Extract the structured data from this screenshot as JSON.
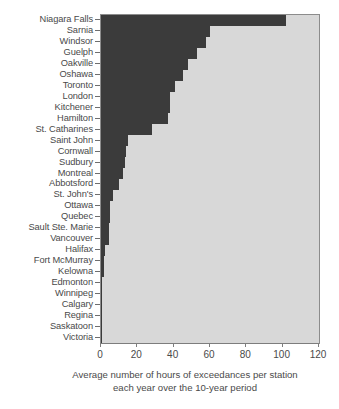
{
  "chart_data": {
    "type": "bar",
    "orientation": "horizontal",
    "title": "",
    "subtitle": "",
    "xlabel": "Average number of hours of exceedances per station each year over the 10-year period",
    "ylabel": "",
    "xlim": [
      0,
      120
    ],
    "xticks": [
      0,
      20,
      40,
      60,
      80,
      100,
      120
    ],
    "xtick_labels": [
      "0",
      "20",
      "40",
      "60",
      "80",
      "100",
      "120"
    ],
    "grid": false,
    "legend": false,
    "bar_color": "#3b3b3b",
    "plot_background": "#d8d8d8",
    "categories": [
      "Niagara Falls",
      "Sarnia",
      "Windsor",
      "Guelph",
      "Oakville",
      "Oshawa",
      "Toronto",
      "London",
      "Kitchener",
      "Hamilton",
      "St. Catharines",
      "Saint John",
      "Cornwall",
      "Sudbury",
      "Montreal",
      "Abbotsford",
      "St. John's",
      "Ottawa",
      "Quebec",
      "Sault Ste. Marie",
      "Vancouver",
      "Halifax",
      "Fort McMurray",
      "Kelowna",
      "Edmonton",
      "Winnipeg",
      "Calgary",
      "Regina",
      "Saskatoon",
      "Victoria"
    ],
    "values": [
      102,
      60,
      58,
      53,
      48,
      45,
      41,
      38,
      38,
      37,
      28,
      15,
      14,
      13,
      12,
      10,
      6.5,
      5,
      5,
      4.5,
      4.5,
      2,
      1.8,
      1.5,
      0.8,
      0.6,
      0.5,
      0.2,
      0.15,
      0.05
    ]
  },
  "caption": {
    "line1": "Average number of hours of exceedances per station",
    "line2": "each year over the 10-year period"
  }
}
